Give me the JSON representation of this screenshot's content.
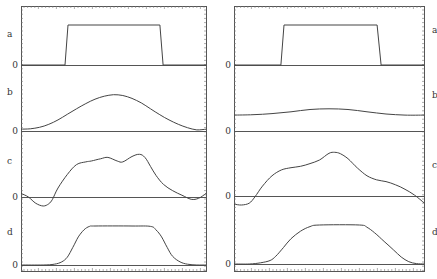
{
  "chart_data": [
    {
      "type": "line",
      "panel": "left",
      "frame": {
        "x0": 21,
        "x1": 206,
        "y0": 6,
        "y1": 271
      },
      "label_side": "left",
      "grid": false,
      "subplots": [
        {
          "label": "a",
          "zero_label": "0",
          "label_y": 34,
          "zero_y": 65,
          "scale": 40,
          "points": [
            [
              0,
              0
            ],
            [
              0.238,
              0
            ],
            [
              0.254,
              1
            ],
            [
              0.751,
              1
            ],
            [
              0.768,
              0
            ],
            [
              1,
              0
            ]
          ]
        },
        {
          "label": "b",
          "zero_label": "0",
          "label_y": 92,
          "zero_y": 131,
          "scale": 37,
          "points": [
            [
              0,
              0.05
            ],
            [
              0.05,
              0.06
            ],
            [
              0.1,
              0.1
            ],
            [
              0.15,
              0.18
            ],
            [
              0.2,
              0.3
            ],
            [
              0.25,
              0.45
            ],
            [
              0.3,
              0.6
            ],
            [
              0.35,
              0.74
            ],
            [
              0.4,
              0.86
            ],
            [
              0.45,
              0.94
            ],
            [
              0.5,
              0.98
            ],
            [
              0.55,
              0.96
            ],
            [
              0.6,
              0.88
            ],
            [
              0.65,
              0.76
            ],
            [
              0.7,
              0.6
            ],
            [
              0.75,
              0.44
            ],
            [
              0.8,
              0.3
            ],
            [
              0.85,
              0.18
            ],
            [
              0.9,
              0.09
            ],
            [
              0.95,
              0.03
            ],
            [
              1,
              0.05
            ]
          ]
        },
        {
          "label": "c",
          "zero_label": "0",
          "label_y": 161,
          "zero_y": 197,
          "scale": 45,
          "points": [
            [
              0,
              0.08
            ],
            [
              0.04,
              0
            ],
            [
              0.08,
              -0.14
            ],
            [
              0.12,
              -0.2
            ],
            [
              0.15,
              -0.15
            ],
            [
              0.17,
              -0.05
            ],
            [
              0.2,
              0.2
            ],
            [
              0.25,
              0.5
            ],
            [
              0.3,
              0.72
            ],
            [
              0.35,
              0.78
            ],
            [
              0.38,
              0.8
            ],
            [
              0.43,
              0.85
            ],
            [
              0.47,
              0.88
            ],
            [
              0.52,
              0.8
            ],
            [
              0.55,
              0.78
            ],
            [
              0.6,
              0.9
            ],
            [
              0.64,
              0.95
            ],
            [
              0.67,
              0.88
            ],
            [
              0.7,
              0.68
            ],
            [
              0.73,
              0.48
            ],
            [
              0.77,
              0.28
            ],
            [
              0.82,
              0.14
            ],
            [
              0.87,
              0.04
            ],
            [
              0.92,
              -0.05
            ],
            [
              0.96,
              -0.03
            ],
            [
              1,
              0.08
            ]
          ]
        },
        {
          "label": "d",
          "zero_label": "0",
          "label_y": 232,
          "zero_y": 265,
          "scale": 39,
          "points": [
            [
              0,
              0
            ],
            [
              0.12,
              0
            ],
            [
              0.18,
              0.02
            ],
            [
              0.22,
              0.08
            ],
            [
              0.25,
              0.2
            ],
            [
              0.28,
              0.45
            ],
            [
              0.31,
              0.72
            ],
            [
              0.34,
              0.9
            ],
            [
              0.37,
              0.99
            ],
            [
              0.4,
              1
            ],
            [
              0.6,
              1
            ],
            [
              0.7,
              0.99
            ],
            [
              0.73,
              0.9
            ],
            [
              0.76,
              0.72
            ],
            [
              0.79,
              0.45
            ],
            [
              0.82,
              0.22
            ],
            [
              0.86,
              0.08
            ],
            [
              0.9,
              0.02
            ],
            [
              0.95,
              0
            ],
            [
              1,
              0
            ]
          ]
        }
      ]
    },
    {
      "type": "line",
      "panel": "right",
      "frame": {
        "x0": 234,
        "x1": 424,
        "y0": 6,
        "y1": 271
      },
      "label_side": "right",
      "grid": false,
      "subplots": [
        {
          "label": "a",
          "zero_label": "0",
          "label_y": 30,
          "zero_y": 65,
          "scale": 40,
          "points": [
            [
              0,
              0
            ],
            [
              0.247,
              0
            ],
            [
              0.263,
              1
            ],
            [
              0.753,
              1
            ],
            [
              0.774,
              0
            ],
            [
              1,
              0
            ]
          ]
        },
        {
          "label": "b",
          "zero_label": "0",
          "label_y": 95,
          "zero_y": 131,
          "scale": 37,
          "points": [
            [
              0,
              0.43
            ],
            [
              0.1,
              0.44
            ],
            [
              0.2,
              0.47
            ],
            [
              0.3,
              0.52
            ],
            [
              0.4,
              0.58
            ],
            [
              0.5,
              0.6
            ],
            [
              0.6,
              0.58
            ],
            [
              0.7,
              0.52
            ],
            [
              0.8,
              0.46
            ],
            [
              0.9,
              0.43
            ],
            [
              1,
              0.43
            ]
          ]
        },
        {
          "label": "c",
          "zero_label": "0",
          "label_y": 165,
          "zero_y": 196,
          "scale": 45,
          "points": [
            [
              0,
              -0.18
            ],
            [
              0.04,
              -0.2
            ],
            [
              0.08,
              -0.16
            ],
            [
              0.11,
              -0.02
            ],
            [
              0.15,
              0.22
            ],
            [
              0.2,
              0.45
            ],
            [
              0.25,
              0.58
            ],
            [
              0.3,
              0.63
            ],
            [
              0.35,
              0.66
            ],
            [
              0.4,
              0.72
            ],
            [
              0.45,
              0.8
            ],
            [
              0.5,
              0.95
            ],
            [
              0.53,
              0.97
            ],
            [
              0.56,
              0.94
            ],
            [
              0.6,
              0.83
            ],
            [
              0.65,
              0.62
            ],
            [
              0.7,
              0.45
            ],
            [
              0.75,
              0.36
            ],
            [
              0.8,
              0.32
            ],
            [
              0.85,
              0.25
            ],
            [
              0.9,
              0.15
            ],
            [
              0.95,
              0.02
            ],
            [
              1,
              -0.15
            ]
          ]
        },
        {
          "label": "d",
          "zero_label": "0",
          "label_y": 232,
          "zero_y": 264,
          "scale": 39,
          "points": [
            [
              0,
              0
            ],
            [
              0.08,
              0
            ],
            [
              0.14,
              0.03
            ],
            [
              0.19,
              0.09
            ],
            [
              0.22,
              0.2
            ],
            [
              0.26,
              0.42
            ],
            [
              0.3,
              0.65
            ],
            [
              0.35,
              0.84
            ],
            [
              0.4,
              0.96
            ],
            [
              0.45,
              1
            ],
            [
              0.66,
              1
            ],
            [
              0.7,
              0.94
            ],
            [
              0.74,
              0.8
            ],
            [
              0.79,
              0.58
            ],
            [
              0.84,
              0.36
            ],
            [
              0.88,
              0.18
            ],
            [
              0.92,
              0.06
            ],
            [
              0.96,
              0.01
            ],
            [
              1,
              0
            ]
          ]
        }
      ]
    }
  ]
}
